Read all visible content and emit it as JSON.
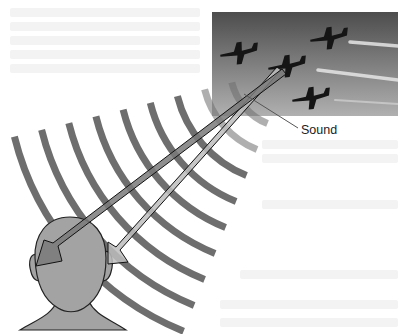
{
  "figure": {
    "label_sound": "Sound",
    "photo": {
      "subject": "four jets flying in formation with smoke contrails",
      "planes": 4,
      "contrails": 3
    },
    "wavefronts_count": 9,
    "arrows": [
      {
        "name": "arrow-to-left-ear",
        "target": "left ear"
      },
      {
        "name": "arrow-to-right-ear",
        "target": "right ear"
      }
    ],
    "colors": {
      "wave": "#6e6e6e",
      "head_fill": "#a3a3a3",
      "head_outline": "#222222",
      "arrow_fill_dark": "#7a7a7a",
      "arrow_fill_light": "#bdbdbd",
      "sky_top": "#4d4d4d",
      "sky_bottom": "#b0b0b0",
      "plane": "#151515",
      "contrail": "#e6e6e6"
    }
  }
}
